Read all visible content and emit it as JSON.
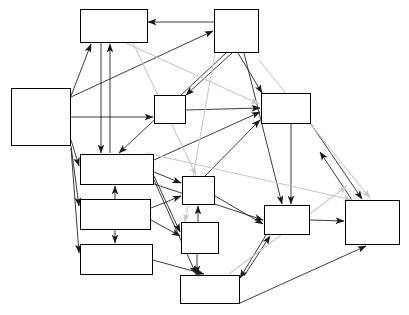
{
  "figure": {
    "style": "black-and-white causal path diagram with boxed constructs and directional arrows"
  },
  "nodes": [
    {
      "id": "parenting_behavior",
      "lines": [
        "Parenting",
        "Behavior"
      ],
      "x": 80,
      "y": 9,
      "w": 68,
      "h": 34
    },
    {
      "id": "active_parental_drinking",
      "lines": [
        "Active",
        "Parental",
        "Drinking"
      ],
      "x": 214,
      "y": 9,
      "w": 45,
      "h": 44
    },
    {
      "id": "family_history",
      "lines": [
        "Family",
        "History",
        "of",
        "Alcoholism"
      ],
      "x": 11,
      "y": 88,
      "w": 60,
      "h": 58
    },
    {
      "id": "life_stress",
      "lines": [
        "Life",
        "Stress"
      ],
      "x": 154,
      "y": 95,
      "w": 32,
      "h": 29
    },
    {
      "id": "emotional_distress",
      "lines": [
        "Emotional",
        "Distress"
      ],
      "x": 261,
      "y": 93,
      "w": 50,
      "h": 31
    },
    {
      "id": "temperament",
      "lines": [
        "Temperament/",
        "Personality"
      ],
      "x": 80,
      "y": 154,
      "w": 74,
      "h": 31
    },
    {
      "id": "school_failure",
      "lines": [
        "School",
        "Failure"
      ],
      "x": 182,
      "y": 176,
      "w": 33,
      "h": 29
    },
    {
      "id": "cognitive_dysfunction",
      "lines": [
        "Cognitive",
        "Dysfunction"
      ],
      "x": 80,
      "y": 199,
      "w": 71,
      "h": 31
    },
    {
      "id": "peer_influence",
      "lines": [
        "Peer",
        "Influence"
      ],
      "x": 264,
      "y": 205,
      "w": 46,
      "h": 30
    },
    {
      "id": "pathological",
      "lines": [
        "Pathological",
        "Alcohol",
        "Involvement"
      ],
      "x": 345,
      "y": 200,
      "w": 55,
      "h": 45
    },
    {
      "id": "coping_ability",
      "lines": [
        "Coping",
        "Ability"
      ],
      "x": 181,
      "y": 222,
      "w": 38,
      "h": 32
    },
    {
      "id": "ethanol_sensitivity",
      "lines": [
        "Ethanol",
        "Sensitivity"
      ],
      "x": 80,
      "y": 244,
      "w": 73,
      "h": 31
    },
    {
      "id": "alcohol_expectancies",
      "lines": [
        "Alcohol",
        "Expectancies"
      ],
      "x": 180,
      "y": 275,
      "w": 60,
      "h": 29
    }
  ],
  "colors": {
    "edge_dark": "#1a1a1a",
    "edge_light": "#c9c9c9",
    "node_border": "#000000",
    "background": "#ffffff"
  },
  "edges": [
    {
      "from": "active_parental_drinking",
      "to": "parenting_behavior",
      "shade": "dark",
      "points": "258,22 148,22"
    },
    {
      "from": "family_history",
      "to": "parenting_behavior",
      "shade": "dark",
      "points": "71,96 91,44"
    },
    {
      "from": "family_history",
      "to": "active_parental_drinking",
      "shade": "dark",
      "points": "71,97 213,31"
    },
    {
      "from": "family_history",
      "to": "life_stress",
      "shade": "dark",
      "points": "71,117 153,117"
    },
    {
      "from": "family_history",
      "to": "temperament",
      "shade": "dark",
      "points": "71,140 79,166"
    },
    {
      "from": "family_history",
      "to": "cognitive_dysfunction",
      "shade": "dark",
      "points": "71,146 79,206"
    },
    {
      "from": "family_history",
      "to": "ethanol_sensitivity",
      "shade": "dark",
      "points": "71,148 79,253"
    },
    {
      "from": "parenting_behavior",
      "to": "temperament",
      "shade": "dark",
      "points": "101,43 101,153"
    },
    {
      "from": "temperament",
      "to": "parenting_behavior",
      "shade": "dark",
      "points": "110,153 110,44"
    },
    {
      "from": "active_parental_drinking",
      "to": "temperament",
      "shade": "dark",
      "points": "226,53 119,153"
    },
    {
      "from": "active_parental_drinking",
      "to": "life_stress",
      "shade": "dark",
      "points": "232,53 186,95"
    },
    {
      "from": "active_parental_drinking",
      "to": "emotional_distress",
      "shade": "dark",
      "points": "238,53 262,93"
    },
    {
      "from": "active_parental_drinking",
      "to": "peer_influence",
      "shade": "dark",
      "points": "244,53 282,204"
    },
    {
      "from": "life_stress",
      "to": "emotional_distress",
      "shade": "dark",
      "points": "186,110 260,108"
    },
    {
      "from": "temperament",
      "to": "emotional_distress",
      "shade": "dark",
      "points": "154,160 260,112"
    },
    {
      "from": "temperament",
      "to": "school_failure",
      "shade": "dark",
      "points": "154,172 181,183"
    },
    {
      "from": "temperament",
      "to": "coping_ability",
      "shade": "dark",
      "points": "154,176 180,232"
    },
    {
      "from": "temperament",
      "to": "alcohol_expectancies",
      "shade": "dark",
      "points": "154,180 196,274"
    },
    {
      "from": "temperament",
      "to": "peer_influence",
      "shade": "dark",
      "points": "154,184 263,220"
    },
    {
      "from": "cognitive_dysfunction",
      "to": "temperament",
      "shade": "dark",
      "points": "115,199 115,186"
    },
    {
      "from": "cognitive_dysfunction",
      "to": "school_failure",
      "shade": "dark",
      "points": "151,208 181,196"
    },
    {
      "from": "cognitive_dysfunction",
      "to": "coping_ability",
      "shade": "dark",
      "points": "151,220 180,236"
    },
    {
      "from": "cognitive_dysfunction",
      "to": "ethanol_sensitivity",
      "shade": "dark",
      "points": "115,230 115,243"
    },
    {
      "from": "ethanol_sensitivity",
      "to": "alcohol_expectancies",
      "shade": "dark",
      "points": "153,260 204,274"
    },
    {
      "from": "coping_ability",
      "to": "school_failure",
      "shade": "dark",
      "points": "198,222 198,206"
    },
    {
      "from": "coping_ability",
      "to": "alcohol_expectancies",
      "shade": "dark",
      "points": "197,254 197,274"
    },
    {
      "from": "school_failure",
      "to": "peer_influence",
      "shade": "dark",
      "points": "215,196 263,224"
    },
    {
      "from": "school_failure",
      "to": "emotional_distress",
      "shade": "dark",
      "points": "205,176 260,120"
    },
    {
      "from": "peer_influence",
      "to": "pathological",
      "shade": "dark",
      "points": "310,220 344,221"
    },
    {
      "from": "peer_influence",
      "to": "alcohol_expectancies",
      "shade": "dark",
      "points": "266,235 240,278"
    },
    {
      "from": "alcohol_expectancies",
      "to": "peer_influence",
      "shade": "dark",
      "points": "244,276 270,236"
    },
    {
      "from": "alcohol_expectancies",
      "to": "pathological",
      "shade": "dark",
      "points": "240,303 366,246"
    },
    {
      "from": "emotional_distress",
      "to": "peer_influence",
      "shade": "dark",
      "points": "291,124 291,204"
    },
    {
      "from": "emotional_distress",
      "to": "pathological",
      "shade": "dark",
      "points": "311,124 362,199"
    },
    {
      "from": "pathological_cross_a",
      "to": "emotional_distress",
      "shade": "dark",
      "points": "352,200 320,152"
    },
    {
      "from": "parenting_behavior",
      "to": "emotional_distress",
      "shade": "light",
      "points": "126,43 259,104"
    },
    {
      "from": "parenting_behavior",
      "to": "school_failure",
      "shade": "light",
      "points": "133,43 196,175"
    },
    {
      "from": "active_parental_drinking",
      "to": "coping_ability",
      "shade": "light",
      "points": "215,53 185,222"
    },
    {
      "from": "active_parental_drinking",
      "to": "pathological",
      "shade": "light",
      "points": "259,60 370,198"
    },
    {
      "from": "temperament",
      "to": "pathological",
      "shade": "light",
      "points": "146,153 352,200"
    },
    {
      "from": "alcohol_expectancies",
      "to": "pathological",
      "shade": "light",
      "points": "229,274 347,186"
    }
  ]
}
